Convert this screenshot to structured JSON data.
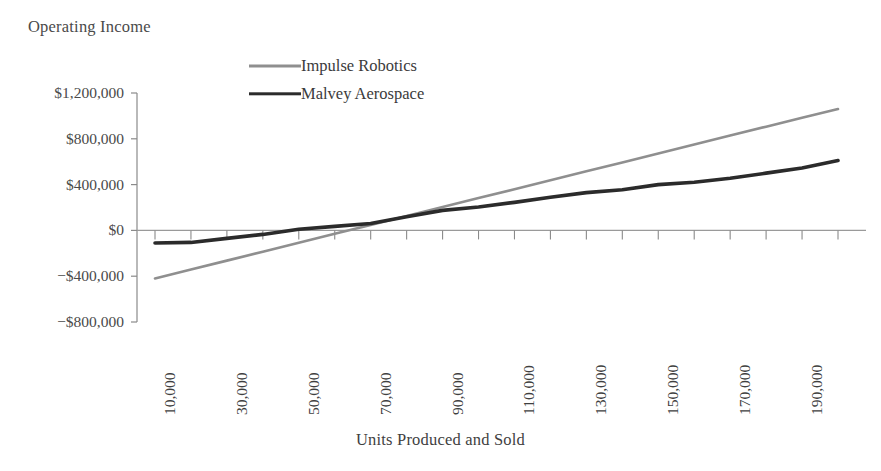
{
  "chart_data": {
    "type": "line",
    "title": "",
    "ylabel": "Operating Income",
    "xlabel": "Units Produced and Sold",
    "grid": false,
    "legend_position": "top-center",
    "x": [
      10000,
      20000,
      30000,
      40000,
      50000,
      60000,
      70000,
      80000,
      90000,
      100000,
      110000,
      120000,
      130000,
      140000,
      150000,
      160000,
      170000,
      180000,
      190000,
      200000
    ],
    "xtick_labels": [
      "10,000",
      "30,000",
      "50,000",
      "70,000",
      "90,000",
      "110,000",
      "130,000",
      "150,000",
      "170,000",
      "190,000"
    ],
    "xtick_values": [
      10000,
      30000,
      50000,
      70000,
      90000,
      110000,
      130000,
      150000,
      170000,
      190000
    ],
    "ytick_labels": [
      "$1,200,000",
      "$800,000",
      "$400,000",
      "$0",
      "−$400,000",
      "−$800,000"
    ],
    "ytick_values": [
      1200000,
      800000,
      400000,
      0,
      -400000,
      -800000
    ],
    "ylim": [
      -800000,
      1200000
    ],
    "xlim": [
      10000,
      200000
    ],
    "series": [
      {
        "name": "Impulse Robotics",
        "color": "#8f8f8f",
        "width": 2.6,
        "values": [
          -420000,
          -342000,
          -264000,
          -186000,
          -108000,
          -30000,
          48000,
          126000,
          204000,
          282000,
          360000,
          438000,
          516000,
          594000,
          672000,
          750000,
          828000,
          906000,
          984000,
          1060000
        ]
      },
      {
        "name": "Malvey Aerospace",
        "color": "#2b2b2b",
        "width": 3.6,
        "values": [
          -110000,
          -105000,
          -70000,
          -35000,
          10000,
          35000,
          60000,
          120000,
          175000,
          205000,
          245000,
          290000,
          330000,
          355000,
          400000,
          420000,
          455000,
          500000,
          545000,
          610000
        ]
      }
    ]
  },
  "legend": {
    "items": [
      {
        "label": "Impulse Robotics",
        "swatch": "line-swatch-gray"
      },
      {
        "label": "Malvey Aerospace",
        "swatch": "line-swatch-black"
      }
    ]
  },
  "axes": {
    "y_title": "Operating Income",
    "x_title": "Units Produced and Sold"
  }
}
